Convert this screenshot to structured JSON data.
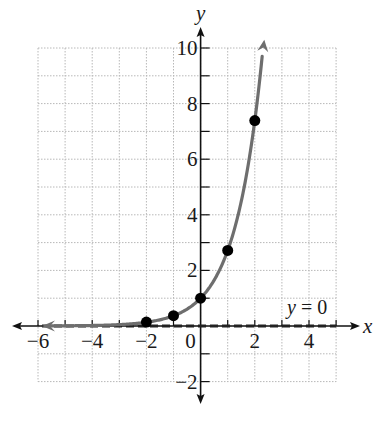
{
  "chart_data": {
    "type": "line",
    "title": "",
    "function": "y = e^x",
    "xlabel": "x",
    "ylabel": "y",
    "xlim": [
      -6,
      5
    ],
    "ylim": [
      -2,
      10
    ],
    "grid": true,
    "x_ticks": [
      -6,
      -5,
      -4,
      -3,
      -2,
      -1,
      0,
      1,
      2,
      3,
      4,
      5
    ],
    "x_tick_labels": [
      {
        "value": -6,
        "label": "−6"
      },
      {
        "value": -4,
        "label": "−4"
      },
      {
        "value": -2,
        "label": "−2"
      },
      {
        "value": 0,
        "label": "0"
      },
      {
        "value": 2,
        "label": "2"
      },
      {
        "value": 4,
        "label": "4"
      }
    ],
    "y_ticks": [
      -2,
      -1,
      1,
      2,
      3,
      4,
      5,
      6,
      7,
      8,
      9,
      10
    ],
    "y_tick_labels": [
      {
        "value": 10,
        "label": "10"
      },
      {
        "value": 8,
        "label": "8"
      },
      {
        "value": 6,
        "label": "6"
      },
      {
        "value": 4,
        "label": "4"
      },
      {
        "value": 2,
        "label": "2"
      },
      {
        "value": -2,
        "label": "−2"
      }
    ],
    "points": [
      {
        "x": -2,
        "y": 0.14
      },
      {
        "x": -1,
        "y": 0.37
      },
      {
        "x": 0,
        "y": 1
      },
      {
        "x": 1,
        "y": 2.72
      },
      {
        "x": 2,
        "y": 7.39
      }
    ],
    "asymptote": {
      "label_var": "y",
      "label_rest": " = 0",
      "y": 0,
      "style": "dashed"
    },
    "colors": {
      "curve": "#6e6e6e",
      "points": "#000000",
      "axes": "#111111",
      "grid": "#b8b8b8",
      "asymptote": "#222222"
    }
  }
}
